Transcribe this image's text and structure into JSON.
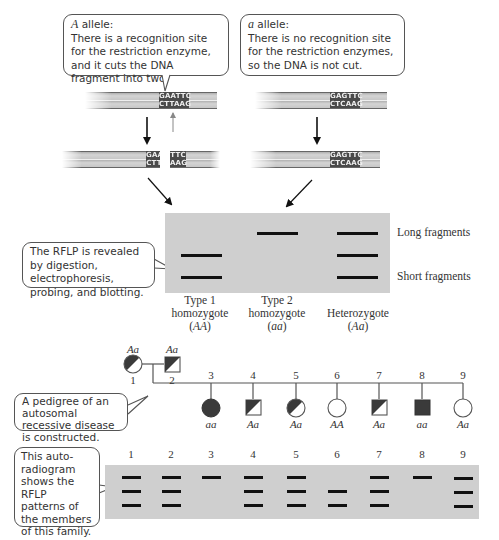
{
  "callouts": {
    "A_allele": {
      "title_italic": "A",
      "title_rest": " allele:",
      "body": "There is a recognition site for the restriction enzyme, and it cuts the DNA fragment into two."
    },
    "a_allele": {
      "title_italic": "a",
      "title_rest": " allele:",
      "body": "There is no recognition site for the restriction enzymes, so the DNA is not cut."
    },
    "rflp": {
      "body": "The RFLP is revealed by digestion, electrophoresis, probing, and blotting."
    },
    "pedigree": {
      "body": "A pedigree of an autosomal recessive disease is constructed."
    },
    "autoradiogram": {
      "body": "This auto-radiogram shows the RFLP patterns of the members of this family."
    }
  },
  "dna": {
    "A_uncut": {
      "top": "GAATTC",
      "bottom": "CTTAAG"
    },
    "a_uncut": {
      "top": "GAGTTC",
      "bottom": "CTCAAG"
    },
    "A_cut_left": {
      "top": "GAA",
      "bottom": "CTT"
    },
    "A_cut_right": {
      "top": "TTC",
      "bottom": "AAG"
    },
    "a_result": {
      "top": "GAGTTC",
      "bottom": "CTCAAG"
    }
  },
  "gel": {
    "fragment_labels": {
      "long": "Long fragments",
      "short": "Short fragments"
    },
    "columns": [
      {
        "line1": "Type 1",
        "line2": "homozygote",
        "genotype": "AA",
        "bands": [
          "middle",
          "short"
        ]
      },
      {
        "line1": "Type 2",
        "line2": "homozygote",
        "genotype": "aa",
        "bands": [
          "long"
        ]
      },
      {
        "line1": "",
        "line2": "Heterozygote",
        "genotype": "Aa",
        "bands": [
          "long",
          "middle",
          "short"
        ]
      }
    ]
  },
  "pedigree": {
    "parents": [
      {
        "id": "1",
        "sex": "female",
        "genotype": "Aa",
        "status": "carrier"
      },
      {
        "id": "2",
        "sex": "male",
        "genotype": "Aa",
        "status": "carrier"
      }
    ],
    "children": [
      {
        "id": "3",
        "sex": "female",
        "genotype": "aa",
        "status": "affected"
      },
      {
        "id": "4",
        "sex": "male",
        "genotype": "Aa",
        "status": "carrier"
      },
      {
        "id": "5",
        "sex": "female",
        "genotype": "Aa",
        "status": "carrier"
      },
      {
        "id": "6",
        "sex": "female",
        "genotype": "AA",
        "status": "unaffected"
      },
      {
        "id": "7",
        "sex": "male",
        "genotype": "Aa",
        "status": "carrier"
      },
      {
        "id": "8",
        "sex": "male",
        "genotype": "aa",
        "status": "affected"
      },
      {
        "id": "9",
        "sex": "female",
        "genotype": "Aa",
        "status": "unaffected-symbol"
      }
    ]
  },
  "autoradiogram": {
    "lanes": [
      {
        "label": "1",
        "bands": [
          "long",
          "middle",
          "short"
        ]
      },
      {
        "label": "2",
        "bands": [
          "long",
          "middle",
          "short"
        ]
      },
      {
        "label": "3",
        "bands": [
          "long"
        ]
      },
      {
        "label": "4",
        "bands": [
          "long",
          "middle",
          "short"
        ]
      },
      {
        "label": "5",
        "bands": [
          "long",
          "middle",
          "short"
        ]
      },
      {
        "label": "6",
        "bands": [
          "middle",
          "short"
        ]
      },
      {
        "label": "7",
        "bands": [
          "long",
          "middle",
          "short"
        ]
      },
      {
        "label": "8",
        "bands": [
          "long"
        ]
      },
      {
        "label": "9",
        "bands": [
          "long",
          "middle",
          "short"
        ]
      }
    ]
  },
  "colors": {
    "gel_bg": "#cfcfcf",
    "band": "#111111",
    "site_box": "#4a4a4a",
    "affected_fill": "#3a3a3a",
    "outline": "#555555"
  }
}
